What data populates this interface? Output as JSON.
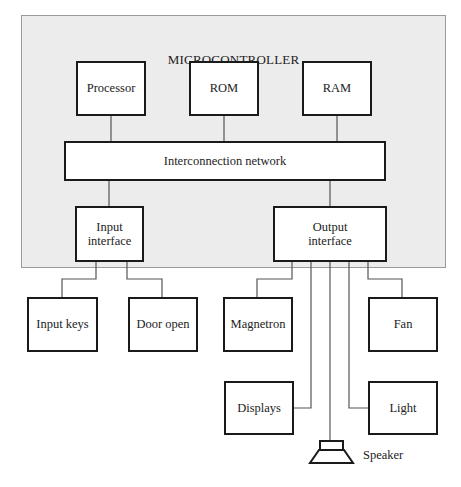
{
  "diagram": {
    "container": {
      "label": "MICROCONTROLLER"
    },
    "memory_blocks": [
      {
        "id": "processor",
        "label": "Processor"
      },
      {
        "id": "rom",
        "label": "ROM"
      },
      {
        "id": "ram",
        "label": "RAM"
      }
    ],
    "bus": {
      "label": "Interconnection network"
    },
    "interfaces": {
      "input": {
        "line1": "Input",
        "line2": "interface"
      },
      "output": {
        "line1": "Output",
        "line2": "interface"
      }
    },
    "inputs": [
      {
        "id": "input-keys",
        "label": "Input keys"
      },
      {
        "id": "door-open",
        "label": "Door open"
      }
    ],
    "outputs": [
      {
        "id": "magnetron",
        "label": "Magnetron"
      },
      {
        "id": "fan",
        "label": "Fan"
      },
      {
        "id": "displays",
        "label": "Displays"
      },
      {
        "id": "light",
        "label": "Light"
      },
      {
        "id": "speaker",
        "label": "Speaker"
      }
    ],
    "colors": {
      "panel_fill": "#ececec",
      "panel_border": "#9a9a9a",
      "box_border": "#1a1a1a",
      "connector": "#555555"
    }
  }
}
